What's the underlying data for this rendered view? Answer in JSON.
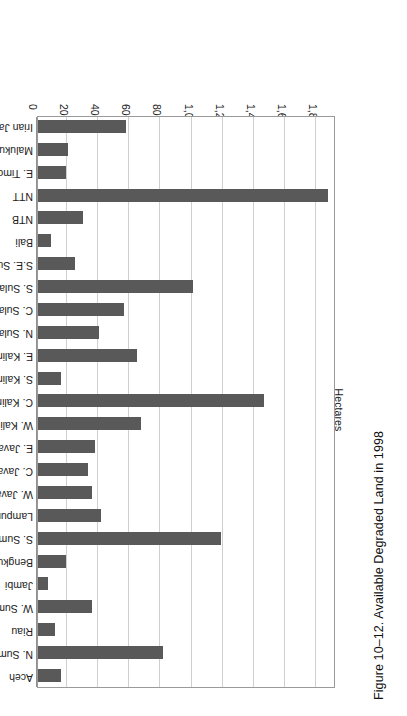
{
  "figure": {
    "caption": "Figure 10–12. Available Degraded Land in 1998"
  },
  "chart_data": {
    "type": "bar",
    "orientation": "horizontal",
    "title": "Figure 10–12. Available Degraded Land in 1998",
    "xlabel": "",
    "ylabel": "Hectares",
    "value_axis_label": "Hectares",
    "value_axis_ticks": [
      "0",
      "200,000",
      "400,000",
      "600,000",
      "800,000",
      "1,000,000",
      "1,200,000",
      "1,400,000",
      "1,600,000",
      "1,800,000"
    ],
    "tick_values": [
      0,
      200000,
      400000,
      600000,
      800000,
      1000000,
      1200000,
      1400000,
      1600000,
      1800000
    ],
    "xlim": [
      0,
      1915000
    ],
    "grid": true,
    "legend": "none",
    "bar_color": "#595959",
    "categories": [
      "Aceh",
      "N. Sumatra",
      "Riau",
      "W. Sumatra",
      "Jambi",
      "Bengkulu",
      "S. Sumatra",
      "Lampung",
      "W. Java",
      "C. Java",
      "E. Java",
      "W. Kalimantan",
      "C. Kalimantan",
      "S. Kalimantan",
      "E. Kalimantan",
      "N. Sulawesi",
      "C. Sulawesi",
      "S. Sulawesi",
      "S.E. Sulawesi",
      "Bali",
      "NTB",
      "NTT",
      "E. Timor",
      "Maluku",
      "Irian Jaya"
    ],
    "values": [
      150000,
      805000,
      110000,
      348000,
      64000,
      180000,
      1178000,
      405000,
      348000,
      322000,
      367000,
      663000,
      1455000,
      148000,
      637000,
      392000,
      553000,
      998000,
      238000,
      84000,
      290000,
      1865000,
      180000,
      193000,
      566000
    ]
  }
}
